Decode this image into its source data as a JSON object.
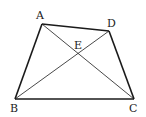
{
  "diagram": {
    "type": "quadrilateral-with-diagonals",
    "stroke_color": "#1a1a1a",
    "points": {
      "A": {
        "x": 42,
        "y": 24,
        "label": "A",
        "lx": 36,
        "ly": 19
      },
      "D": {
        "x": 109,
        "y": 31,
        "label": "D",
        "lx": 108,
        "ly": 27
      },
      "B": {
        "x": 15,
        "y": 99,
        "label": "B",
        "lx": 10,
        "ly": 112
      },
      "C": {
        "x": 134,
        "y": 99,
        "label": "C",
        "lx": 129,
        "ly": 112
      },
      "E": {
        "x": 79,
        "y": 55,
        "label": "E",
        "lx": 74,
        "ly": 48
      }
    },
    "sides": [
      [
        "A",
        "D"
      ],
      [
        "D",
        "C"
      ],
      [
        "C",
        "B"
      ],
      [
        "B",
        "A"
      ]
    ],
    "diagonals": [
      [
        "A",
        "C"
      ],
      [
        "B",
        "D"
      ]
    ]
  }
}
